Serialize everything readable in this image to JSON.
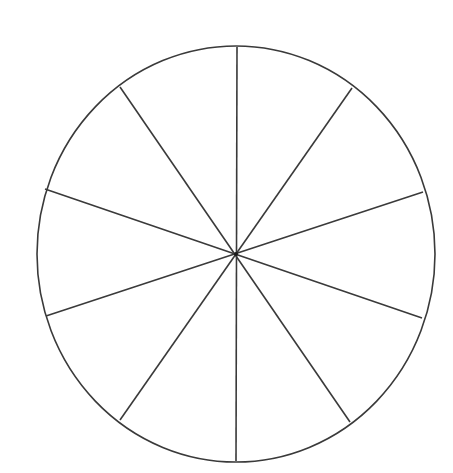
{
  "diagram": {
    "type": "segmented-circle",
    "segments": 10,
    "center": {
      "x": 236,
      "y": 254
    },
    "radius_x": 199,
    "radius_y": 208,
    "stroke_color": "#3a3a3a",
    "background": "#ffffff",
    "spokes": [
      {
        "x1": 237,
        "y1": 47,
        "x2": 236,
        "y2": 461
      },
      {
        "x1": 352,
        "y1": 88,
        "x2": 120,
        "y2": 420
      },
      {
        "x1": 423,
        "y1": 192,
        "x2": 46,
        "y2": 316
      },
      {
        "x1": 422,
        "y1": 318,
        "x2": 45,
        "y2": 189
      },
      {
        "x1": 350,
        "y1": 422,
        "x2": 120,
        "y2": 87
      }
    ]
  }
}
